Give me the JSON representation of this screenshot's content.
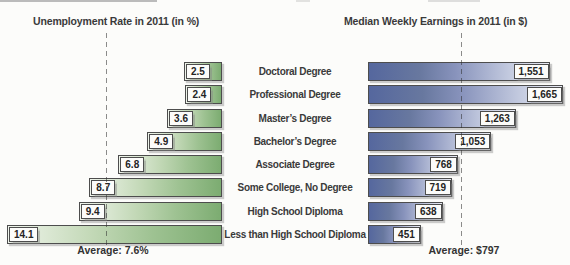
{
  "page": {
    "background": "#fcfcfa"
  },
  "colors": {
    "green_bar_light": "#f0f5ec",
    "green_bar_dark": "#7cac71",
    "blue_bar_dark": "#55679e",
    "blue_bar_light": "#e9ebf3",
    "bar_border": "#4d4d4d",
    "text": "#3a3a3a",
    "dashed_line": "#6e6e6e"
  },
  "chart_data": {
    "type": "bar",
    "orientation": "horizontal-bidirectional",
    "grid": false,
    "legend": false,
    "categories": [
      "Doctoral Degree",
      "Professional Degree",
      "Master’s Degree",
      "Bachelor’s Degree",
      "Associate Degree",
      "Some College, No Degree",
      "High School Diploma",
      "Less than High School Diploma"
    ],
    "series": [
      {
        "name": "Unemployment Rate in 2011 (in %)",
        "unit": "%",
        "direction": "left",
        "values": [
          2.5,
          2.4,
          3.6,
          4.9,
          6.8,
          8.7,
          9.4,
          14.1
        ],
        "display": [
          "2.5",
          "2.4",
          "3.6",
          "4.9",
          "6.8",
          "8.7",
          "9.4",
          "14.1"
        ],
        "axis_range": [
          0,
          14.6
        ],
        "average": 7.6,
        "average_label": "Average: 7.6%"
      },
      {
        "name": "Median Weekly Earnings in 2011 (in $)",
        "unit": "$",
        "direction": "right",
        "values": [
          1551,
          1665,
          1263,
          1053,
          768,
          719,
          638,
          451
        ],
        "display": [
          "1,551",
          "1,665",
          "1,263",
          "1,053",
          "768",
          "719",
          "638",
          "451"
        ],
        "axis_range": [
          0,
          1725
        ],
        "average": 797,
        "average_label": "Average: $797"
      }
    ]
  }
}
